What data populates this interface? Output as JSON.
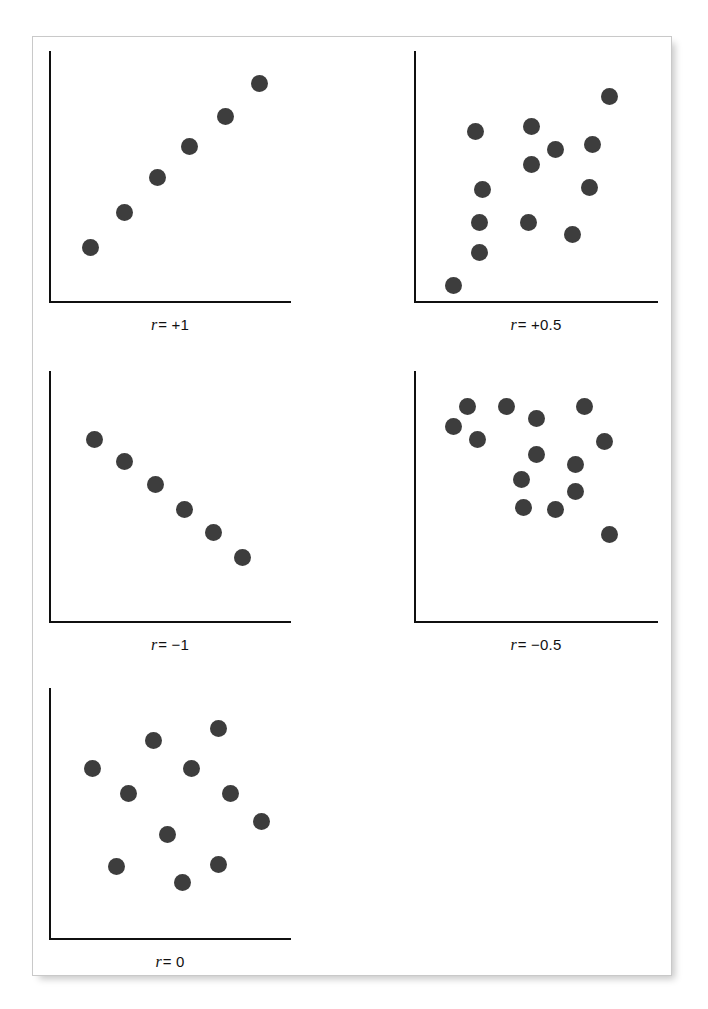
{
  "figure": {
    "background_color": "#ffffff",
    "card_border_color": "#c9c9c9",
    "axis_color": "#101010",
    "dot_color": "#3d3d3d",
    "dot_diameter": 17
  },
  "chart_data": [
    {
      "type": "scatter",
      "title": "r = +1",
      "label_variable": "r",
      "label_value": "= +1",
      "xlabel": "",
      "ylabel": "",
      "xlim": [
        0,
        100
      ],
      "ylim": [
        0,
        100
      ],
      "grid": false,
      "legend": "none",
      "n_points": 6,
      "points": [
        {
          "x": 17,
          "y": 22
        },
        {
          "x": 31,
          "y": 36
        },
        {
          "x": 45,
          "y": 50
        },
        {
          "x": 58,
          "y": 62
        },
        {
          "x": 73,
          "y": 74
        },
        {
          "x": 87,
          "y": 87
        }
      ]
    },
    {
      "type": "scatter",
      "title": "r = +0.5",
      "label_variable": "r",
      "label_value": "= +0.5",
      "xlabel": "",
      "ylabel": "",
      "xlim": [
        0,
        100
      ],
      "ylim": [
        0,
        100
      ],
      "grid": false,
      "legend": "none",
      "n_points": 14,
      "points": [
        {
          "x": 16,
          "y": 7
        },
        {
          "x": 27,
          "y": 20
        },
        {
          "x": 27,
          "y": 32
        },
        {
          "x": 28,
          "y": 45
        },
        {
          "x": 25,
          "y": 68
        },
        {
          "x": 47,
          "y": 32
        },
        {
          "x": 48,
          "y": 55
        },
        {
          "x": 48,
          "y": 70
        },
        {
          "x": 58,
          "y": 61
        },
        {
          "x": 65,
          "y": 27
        },
        {
          "x": 72,
          "y": 46
        },
        {
          "x": 73,
          "y": 63
        },
        {
          "x": 80,
          "y": 82
        }
      ]
    },
    {
      "type": "scatter",
      "title": "r = −1",
      "label_variable": "r",
      "label_value": "= −1",
      "xlabel": "",
      "ylabel": "",
      "xlim": [
        0,
        100
      ],
      "ylim": [
        0,
        100
      ],
      "grid": false,
      "legend": "none",
      "n_points": 6,
      "points": [
        {
          "x": 19,
          "y": 73
        },
        {
          "x": 31,
          "y": 64
        },
        {
          "x": 44,
          "y": 55
        },
        {
          "x": 56,
          "y": 45
        },
        {
          "x": 68,
          "y": 36
        },
        {
          "x": 80,
          "y": 26
        }
      ]
    },
    {
      "type": "scatter",
      "title": "r = −0.5",
      "label_variable": "r",
      "label_value": "= −0.5",
      "xlabel": "",
      "ylabel": "",
      "xlim": [
        0,
        100
      ],
      "ylim": [
        0,
        100
      ],
      "grid": false,
      "legend": "none",
      "n_points": 14,
      "points": [
        {
          "x": 16,
          "y": 78
        },
        {
          "x": 22,
          "y": 86
        },
        {
          "x": 26,
          "y": 73
        },
        {
          "x": 38,
          "y": 86
        },
        {
          "x": 50,
          "y": 81
        },
        {
          "x": 50,
          "y": 67
        },
        {
          "x": 44,
          "y": 57
        },
        {
          "x": 45,
          "y": 46
        },
        {
          "x": 58,
          "y": 45
        },
        {
          "x": 66,
          "y": 63
        },
        {
          "x": 66,
          "y": 52
        },
        {
          "x": 70,
          "y": 86
        },
        {
          "x": 78,
          "y": 72
        },
        {
          "x": 80,
          "y": 35
        }
      ]
    },
    {
      "type": "scatter",
      "title": "r = 0",
      "label_variable": "r",
      "label_value": "= 0",
      "xlabel": "",
      "ylabel": "",
      "xlim": [
        0,
        100
      ],
      "ylim": [
        0,
        100
      ],
      "grid": false,
      "legend": "none",
      "n_points": 11,
      "points": [
        {
          "x": 18,
          "y": 68
        },
        {
          "x": 33,
          "y": 58
        },
        {
          "x": 43,
          "y": 79
        },
        {
          "x": 49,
          "y": 42
        },
        {
          "x": 59,
          "y": 68
        },
        {
          "x": 70,
          "y": 84
        },
        {
          "x": 75,
          "y": 58
        },
        {
          "x": 88,
          "y": 47
        },
        {
          "x": 28,
          "y": 29
        },
        {
          "x": 55,
          "y": 23
        },
        {
          "x": 70,
          "y": 30
        }
      ]
    }
  ]
}
